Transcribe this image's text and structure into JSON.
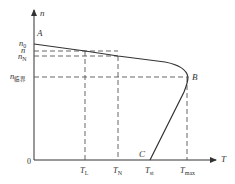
{
  "diagram": {
    "type": "motor-mechanical-characteristic",
    "axes": {
      "y_label": "n",
      "x_label": "T",
      "origin_label": "0"
    },
    "y_ticks": [
      {
        "id": "n0",
        "base": "n",
        "sub": "0"
      },
      {
        "id": "n",
        "base": "n",
        "sub": ""
      },
      {
        "id": "nN",
        "base": "n",
        "sub": "N"
      },
      {
        "id": "ncrit",
        "base": "n",
        "sub": "临界"
      }
    ],
    "x_ticks": [
      {
        "id": "TL",
        "base": "T",
        "sub": "L"
      },
      {
        "id": "TN",
        "base": "T",
        "sub": "N"
      },
      {
        "id": "Tst",
        "base": "T",
        "sub": "st"
      },
      {
        "id": "Tmax",
        "base": "T",
        "sub": "max"
      }
    ],
    "points": {
      "A": "A",
      "B": "B",
      "C": "C"
    },
    "colors": {
      "line": "#333333",
      "dash": "#555555",
      "background": "#ffffff"
    }
  }
}
